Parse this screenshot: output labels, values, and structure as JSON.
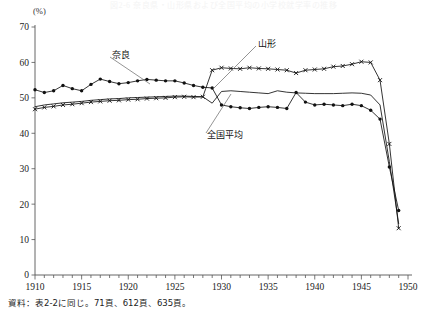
{
  "figure": {
    "title": "図2-6 奈良県・山形県および全国平均の小学校就学率の推移",
    "unit_label": "(%)",
    "source_note": "資料：表2-2に同じ。71頁、612頁、635頁。"
  },
  "annotations": [
    {
      "name": "nara",
      "label": "奈良"
    },
    {
      "name": "yamagata",
      "label": "山形"
    },
    {
      "name": "national-average",
      "label": "全国平均"
    }
  ],
  "chart_data": {
    "type": "line",
    "title": "図2-6 奈良県・山形県および全国平均の小学校就学率の推移",
    "xlabel": "",
    "ylabel": "(%)",
    "xlim": [
      1910,
      1950
    ],
    "ylim": [
      0,
      70
    ],
    "yticks": [
      0,
      10,
      20,
      30,
      40,
      50,
      60,
      70
    ],
    "xticks": [
      1910,
      1915,
      1920,
      1925,
      1930,
      1935,
      1940,
      1945,
      1950
    ],
    "minor_xtick_step": 1,
    "grid": false,
    "legend_position": "inline-annotations",
    "x": [
      1910,
      1911,
      1912,
      1913,
      1914,
      1915,
      1916,
      1917,
      1918,
      1919,
      1920,
      1921,
      1922,
      1923,
      1924,
      1925,
      1926,
      1927,
      1928,
      1929,
      1930,
      1931,
      1932,
      1933,
      1934,
      1935,
      1936,
      1937,
      1938,
      1939,
      1940,
      1941,
      1942,
      1943,
      1944,
      1945,
      1946,
      1947,
      1948,
      1949
    ],
    "series": [
      {
        "name": "奈良",
        "marker": "circle",
        "values": [
          52.3,
          51.5,
          52.0,
          53.5,
          52.6,
          52.0,
          53.8,
          55.3,
          54.6,
          54.0,
          54.3,
          54.8,
          55.2,
          55.0,
          54.8,
          54.8,
          54.2,
          53.5,
          53.0,
          52.8,
          48.0,
          47.5,
          47.2,
          47.0,
          47.3,
          47.5,
          47.3,
          47.0,
          51.5,
          48.8,
          48.0,
          48.2,
          48.0,
          47.8,
          48.2,
          47.8,
          46.5,
          44.0,
          30.5,
          18.2
        ]
      },
      {
        "name": "山形",
        "marker": "x",
        "values": [
          46.8,
          47.3,
          47.6,
          48.0,
          48.2,
          48.5,
          48.8,
          49.0,
          49.2,
          49.3,
          49.5,
          49.6,
          49.8,
          49.9,
          50.0,
          50.2,
          50.3,
          50.2,
          50.3,
          57.8,
          58.5,
          58.3,
          58.2,
          58.5,
          58.3,
          58.2,
          58.0,
          57.8,
          57.0,
          57.8,
          58.0,
          58.2,
          58.8,
          59.0,
          59.5,
          60.2,
          60.0,
          55.0,
          37.0,
          13.2
        ]
      },
      {
        "name": "全国平均",
        "marker": "none",
        "values": [
          47.5,
          48.0,
          48.3,
          48.6,
          48.8,
          49.0,
          49.3,
          49.5,
          49.7,
          49.8,
          50.0,
          50.1,
          50.2,
          50.3,
          50.4,
          50.5,
          50.5,
          50.4,
          50.3,
          48.5,
          51.8,
          52.0,
          51.8,
          51.6,
          51.4,
          51.2,
          52.0,
          51.6,
          51.4,
          51.3,
          51.2,
          51.2,
          51.2,
          51.3,
          51.4,
          51.3,
          50.8,
          48.0,
          32.0,
          14.5
        ]
      }
    ]
  }
}
